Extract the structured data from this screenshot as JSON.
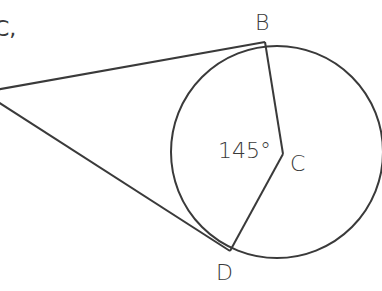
{
  "diagram": {
    "type": "circle-with-tangents",
    "cutoff_text": "C,",
    "points": {
      "B": {
        "label": "B"
      },
      "C": {
        "label": "C"
      },
      "D": {
        "label": "D"
      }
    },
    "angle_label": "145°",
    "colors": {
      "stroke": "#3a3a3a",
      "background": "#ffffff"
    }
  }
}
